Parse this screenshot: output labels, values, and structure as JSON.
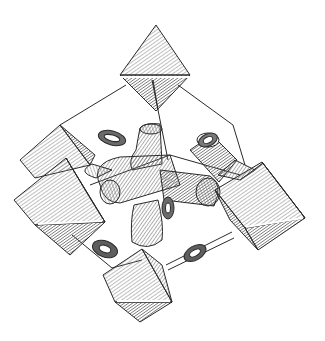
{
  "figure": {
    "colors": {
      "background": "#ffffff",
      "ink": "#2a2a2a",
      "hatch_light": "#9a9a9a",
      "hatch_dark": "#555555",
      "ring_fill": "#6a6a6a"
    },
    "octahedra": [
      {
        "name": "top",
        "cx": 156,
        "cy": 78
      },
      {
        "name": "upper-left",
        "cx": 40,
        "cy": 168
      },
      {
        "name": "left",
        "cx": 60,
        "cy": 205
      },
      {
        "name": "upper-right",
        "cx": 225,
        "cy": 160
      },
      {
        "name": "right",
        "cx": 262,
        "cy": 200
      },
      {
        "name": "bottom",
        "cx": 140,
        "cy": 295
      }
    ],
    "rings": [
      {
        "name": "ring-upper-left",
        "cx": 112,
        "cy": 138
      },
      {
        "name": "ring-upper-right",
        "cx": 208,
        "cy": 140
      },
      {
        "name": "ring-center",
        "cx": 168,
        "cy": 208
      },
      {
        "name": "ring-lower-left",
        "cx": 105,
        "cy": 249
      },
      {
        "name": "ring-lower-right",
        "cx": 195,
        "cy": 253
      }
    ]
  }
}
